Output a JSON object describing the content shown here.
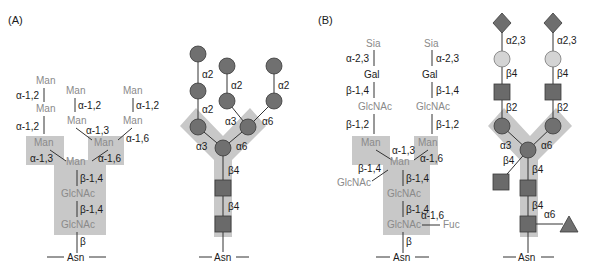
{
  "panels": {
    "A": {
      "label": "(A)",
      "text_diagram": {
        "man_labels": [
          "Man",
          "Man",
          "Man",
          "Man",
          "Man",
          "Man",
          "Man",
          "Man"
        ],
        "glcnac_labels": [
          "GlcNAc",
          "GlcNAc"
        ],
        "linkages": {
          "a12_left_top": "α-1,2",
          "a12_left_bot": "α-1,2",
          "a12_mid": "α-1,2",
          "a12_right": "α-1,2",
          "a13_upper": "α-1,3",
          "a16_upper": "α-1,6",
          "a13_lower": "α-1,3",
          "a16_lower": "α-1,6",
          "b14_top": "β-1,4",
          "b14_bot": "β-1,4",
          "beta": "β"
        },
        "asn": "Asn"
      },
      "symbol_diagram": {
        "linkages": {
          "a2_left_top": "α2",
          "a2_left_bot": "α2",
          "a2_mid": "α2",
          "a2_right": "α2",
          "a3_upper": "α3",
          "a6_upper": "α6",
          "a3_lower": "α3",
          "a6_lower": "α6",
          "b4_top": "β4",
          "b4_bot": "β4"
        },
        "asn": "Asn"
      }
    },
    "B": {
      "label": "(B)",
      "text_diagram": {
        "sia": "Sia",
        "gal": "Gal",
        "glcnac": "GlcNAc",
        "man": "Man",
        "fuc": "Fuc",
        "linkages": {
          "a23": "α-2,3",
          "b14": "β-1,4",
          "b12": "β-1,2",
          "a13": "α-1,3",
          "a16": "α-1,6",
          "beta": "β"
        },
        "asn": "Asn"
      },
      "symbol_diagram": {
        "linkages": {
          "a23": "α2,3",
          "b4": "β4",
          "b2": "β2",
          "a3": "α3",
          "a6": "α6"
        },
        "asn": "Asn"
      }
    }
  },
  "colors": {
    "background_block": "#c8c8c8",
    "mannose": "#707070",
    "glcnac": "#6a6a6a",
    "galactose": "#d4d4d4",
    "sialic_acid": "#6e6e6e",
    "fucose": "#707070",
    "gray_text": "#8a8a8a"
  }
}
